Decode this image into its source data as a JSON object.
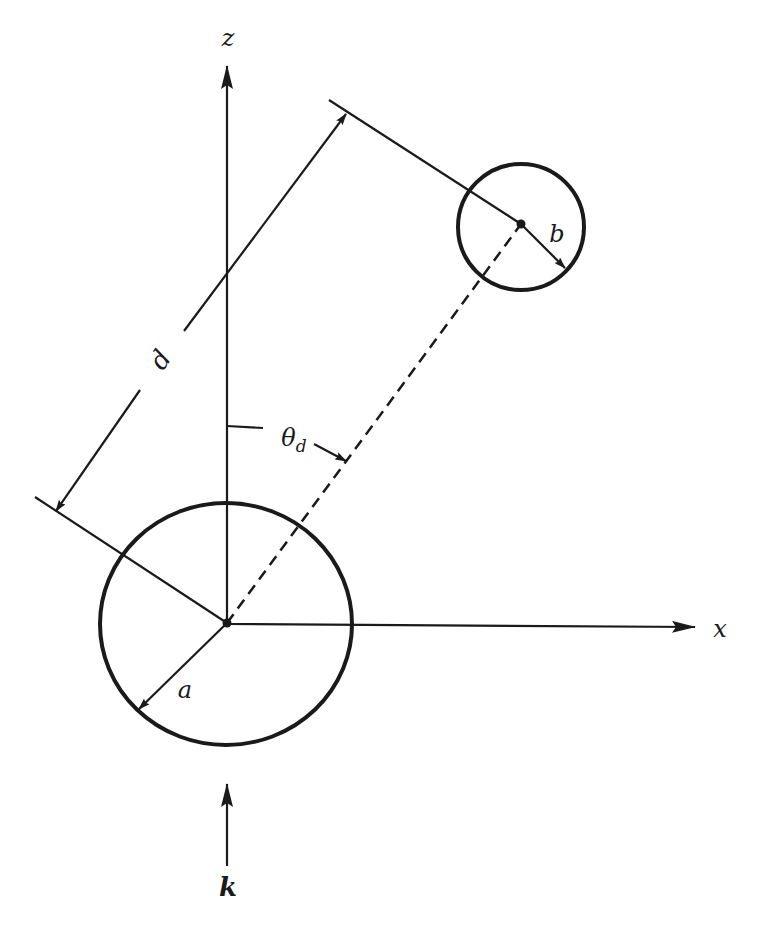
{
  "figure": {
    "type": "geometry-diagram"
  },
  "axes": {
    "z_label": "z",
    "x_label": "x"
  },
  "labels": {
    "distance": "d",
    "angle": "θ",
    "angle_subscript": "d",
    "radius_large": "a",
    "radius_small": "b",
    "wave_vector": "k"
  },
  "colors": {
    "stroke": "#1a1a1a",
    "background": "#ffffff"
  }
}
